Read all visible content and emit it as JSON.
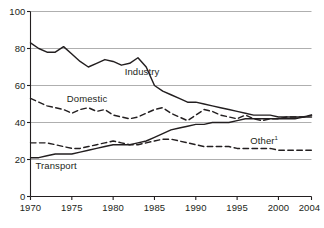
{
  "chart_data": {
    "type": "line",
    "title": "",
    "subtitle": "",
    "xlabel": "",
    "ylabel": "",
    "xlim": [
      1970,
      2004
    ],
    "ylim": [
      0,
      100
    ],
    "grid": true,
    "legend_position": "inline-labels",
    "x": [
      1970,
      1971,
      1972,
      1973,
      1974,
      1975,
      1976,
      1977,
      1978,
      1979,
      1980,
      1981,
      1982,
      1983,
      1984,
      1985,
      1986,
      1987,
      1988,
      1989,
      1990,
      1991,
      1992,
      1993,
      1994,
      1995,
      1996,
      1997,
      1998,
      1999,
      2000,
      2001,
      2002,
      2003,
      2004
    ],
    "xticks": [
      1970,
      1975,
      1980,
      1985,
      1990,
      1995,
      2000,
      2004
    ],
    "yticks": [
      0,
      20,
      40,
      60,
      80,
      100
    ],
    "series": [
      {
        "name": "Industry",
        "style": "solid",
        "color": "#231f20",
        "label": "Industry",
        "label_x": 1981.4,
        "label_y": 67.5,
        "values": [
          83,
          80,
          78,
          78,
          81,
          77,
          73,
          70,
          72,
          74,
          73,
          71,
          72,
          75,
          70,
          60,
          57,
          55,
          53,
          51,
          51,
          50,
          49,
          48,
          47,
          46,
          45,
          44,
          44,
          44,
          43,
          43,
          43,
          43,
          43
        ]
      },
      {
        "name": "Domestic",
        "style": "dashed",
        "color": "#231f20",
        "label": "Domestic",
        "label_x": 1974.4,
        "label_y": 52.5,
        "values": [
          53,
          51,
          49,
          48,
          47,
          45,
          47,
          48,
          46,
          47,
          44,
          43,
          42,
          43,
          45,
          47,
          48,
          45,
          43,
          41,
          44,
          47,
          46,
          44,
          43,
          42,
          44,
          42,
          41,
          42,
          42,
          43,
          43,
          43,
          44
        ]
      },
      {
        "name": "Transport",
        "style": "solid",
        "color": "#231f20",
        "label": "Transport",
        "label_x": 1970.6,
        "label_y": 16.5,
        "values": [
          21,
          21,
          22,
          23,
          23,
          23,
          24,
          25,
          26,
          27,
          28,
          28,
          28,
          29,
          30,
          32,
          34,
          36,
          37,
          38,
          39,
          39,
          40,
          40,
          40,
          41,
          42,
          42,
          42,
          42,
          42,
          42,
          42,
          43,
          44
        ]
      },
      {
        "name": "Other",
        "style": "dashed",
        "color": "#231f20",
        "label": "Other",
        "label_superscript": "1",
        "label_x": 1996.6,
        "label_y": 30.0,
        "values": [
          29,
          29,
          29,
          28,
          27,
          26,
          26,
          27,
          28,
          29,
          30,
          29,
          28,
          28,
          29,
          30,
          31,
          31,
          30,
          29,
          28,
          27,
          27,
          27,
          27,
          26,
          26,
          26,
          26,
          26,
          25,
          25,
          25,
          25,
          25
        ]
      }
    ]
  },
  "axis": {
    "y_tick_labels": [
      "0",
      "20",
      "40",
      "60",
      "80",
      "100"
    ],
    "x_tick_labels": [
      "1970",
      "1975",
      "1980",
      "1985",
      "1990",
      "1995",
      "2000",
      "2004"
    ]
  },
  "colors": {
    "line": "#231f20",
    "grid": "#9a9a9a",
    "axis": "#231f20",
    "background": "#ffffff"
  }
}
